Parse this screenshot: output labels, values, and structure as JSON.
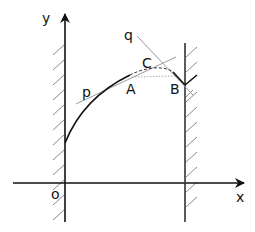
{
  "diagram": {
    "axes": {
      "x_label": "x",
      "y_label": "y",
      "origin_label": "o"
    },
    "points": {
      "A": "A",
      "B": "B",
      "C": "C"
    },
    "lines": {
      "p": "p",
      "q": "q"
    },
    "colors": {
      "ink": "#111111",
      "thin_line": "#9a9a9a",
      "hatch": "#8a8a8a",
      "dashed": "#333333",
      "dotted": "#aaaaaa"
    }
  }
}
